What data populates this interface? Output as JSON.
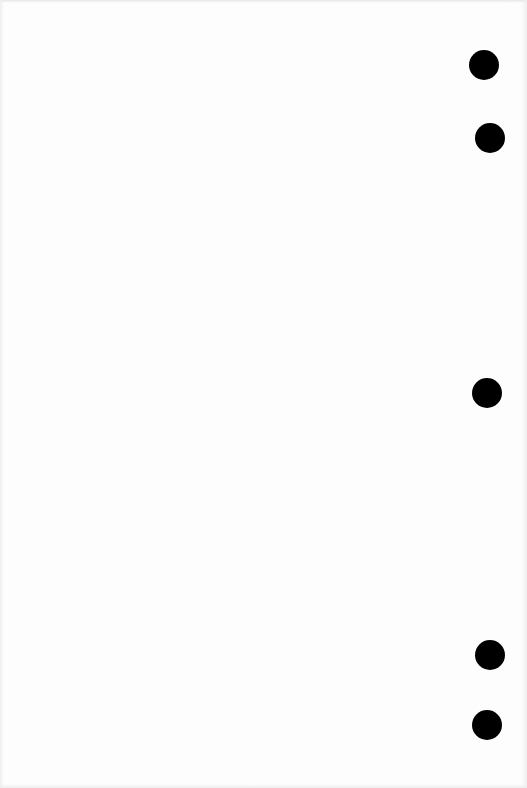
{
  "page": {
    "type": "blank planner/binder page",
    "background_color": "#fdfdfd",
    "content_text": ""
  },
  "holes": [
    {
      "cx": 484,
      "cy": 65,
      "r": 15,
      "color": "#000000"
    },
    {
      "cx": 490,
      "cy": 138,
      "r": 15,
      "color": "#000000"
    },
    {
      "cx": 487,
      "cy": 393,
      "r": 15,
      "color": "#000000"
    },
    {
      "cx": 490,
      "cy": 655,
      "r": 15,
      "color": "#000000"
    },
    {
      "cx": 487,
      "cy": 725,
      "r": 15,
      "color": "#000000"
    }
  ]
}
